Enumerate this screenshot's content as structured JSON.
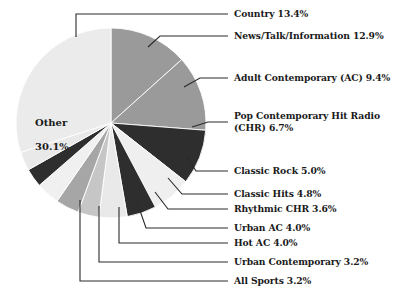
{
  "chart_data": {
    "type": "pie",
    "title": "",
    "subtitle": "",
    "xlabel": "",
    "ylabel": "",
    "units": "percent",
    "legend_position": "callout-labels",
    "grid": false,
    "start_angle_deg": 0,
    "direction": "clockwise",
    "categories": [
      "Country",
      "News/Talk/Information",
      "Adult Contemporary (AC)",
      "Pop Contemporary Hit Radio (CHR)",
      "Classic Rock",
      "Classic Hits",
      "Rhythmic CHR",
      "Urban AC",
      "Hot AC",
      "Urban Contemporary",
      "All Sports",
      "Other"
    ],
    "values": [
      13.4,
      12.9,
      9.4,
      6.7,
      5.0,
      4.8,
      3.6,
      4.0,
      4.0,
      3.2,
      3.2,
      30.1
    ],
    "colors": [
      "#9a9a9a",
      "#9a9a9a",
      "#2e2e2e",
      "#efefef",
      "#2e2e2e",
      "#e9e9e9",
      "#c6c6c6",
      "#a6a6a6",
      "#f0f0f0",
      "#2e2e2e",
      "#e9e9e9",
      "#ebebeb"
    ],
    "slices": [
      {
        "label": "Country",
        "value": 13.4,
        "value_text": "13.4%",
        "color": "#9a9a9a"
      },
      {
        "label": "News/Talk/Information",
        "value": 12.9,
        "value_text": "12.9%",
        "color": "#9a9a9a"
      },
      {
        "label": "Adult Contemporary (AC)",
        "value": 9.4,
        "value_text": "9.4%",
        "color": "#2e2e2e"
      },
      {
        "label": "Pop Contemporary Hit Radio (CHR)",
        "value": 6.7,
        "value_text": "6.7%",
        "color": "#efefef"
      },
      {
        "label": "Classic Rock",
        "value": 5.0,
        "value_text": "5.0%",
        "color": "#2e2e2e"
      },
      {
        "label": "Classic Hits",
        "value": 4.8,
        "value_text": "4.8%",
        "color": "#e9e9e9"
      },
      {
        "label": "Rhythmic CHR",
        "value": 3.6,
        "value_text": "3.6%",
        "color": "#c6c6c6"
      },
      {
        "label": "Urban AC",
        "value": 4.0,
        "value_text": "4.0%",
        "color": "#a6a6a6"
      },
      {
        "label": "Hot AC",
        "value": 4.0,
        "value_text": "4.0%",
        "color": "#f0f0f0"
      },
      {
        "label": "Urban Contemporary",
        "value": 3.2,
        "value_text": "3.2%",
        "color": "#2e2e2e"
      },
      {
        "label": "All Sports",
        "value": 3.2,
        "value_text": "3.2%",
        "color": "#e9e9e9"
      },
      {
        "label": "Other",
        "value": 30.1,
        "value_text": "30.1%",
        "color": "#ebebeb"
      }
    ]
  },
  "callouts": {
    "country": "Country 13.4%",
    "news_talk": "News/Talk/Information 12.9%",
    "adult_contemporary": "Adult Contemporary (AC) 9.4%",
    "pop_chr_line1": "Pop Contemporary Hit Radio",
    "pop_chr_line2": "(CHR) 6.7%",
    "classic_rock": "Classic Rock 5.0%",
    "classic_hits": "Classic Hits 4.8%",
    "rhythmic_chr": "Rhythmic CHR 3.6%",
    "urban_ac": "Urban AC 4.0%",
    "hot_ac": "Hot AC 4.0%",
    "urban_contemporary": "Urban Contemporary 3.2%",
    "all_sports": "All Sports 3.2%"
  },
  "inner_labels": {
    "other_name": "Other",
    "other_value": "30.1%"
  },
  "style": {
    "background": "#ffffff",
    "leader_line_color": "#2b2b2b",
    "slice_separator_color": "#ffffff",
    "text_color": "#1b1b1b"
  }
}
